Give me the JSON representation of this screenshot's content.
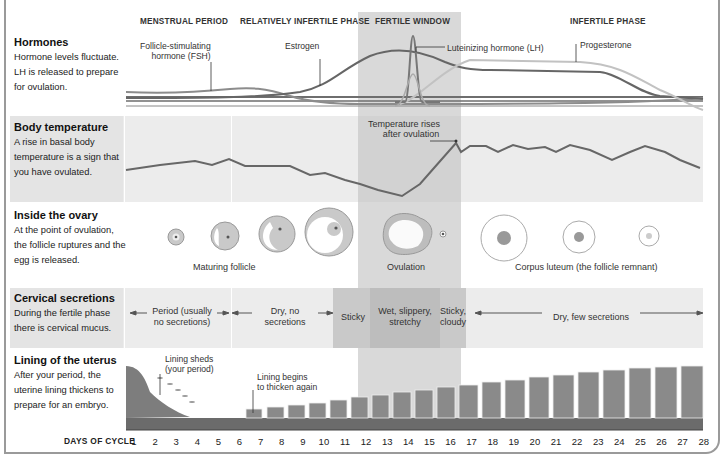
{
  "phases": [
    {
      "label": "MENSTRUAL PERIOD",
      "x": 140
    },
    {
      "label": "RELATIVELY INFERTILE PHASE",
      "x": 240
    },
    {
      "label": "FERTILE WINDOW",
      "x": 373
    },
    {
      "label": "INFERTILE PHASE",
      "x": 568
    }
  ],
  "sections": {
    "hormones": {
      "title": "Hormones",
      "description": "Hormone levels fluctuate. LH is released to prepare for ovulation.",
      "labels": {
        "fsh": "Follicle-stimulating hormone (FSH)",
        "fsh_line1": "Follicle-stimulating",
        "fsh_line2": "hormone (FSH)",
        "estrogen": "Estrogen",
        "lh": "Luteinizing hormone (LH)",
        "progesterone": "Progesterone"
      }
    },
    "body_temperature": {
      "title": "Body temperature",
      "description": "A rise in basal body temperature is a sign that you have ovulated.",
      "annotation_line1": "Temperature rises",
      "annotation_line2": "after ovulation"
    },
    "ovary": {
      "title": "Inside the ovary",
      "description": "At the point of ovulation, the follicle ruptures and the egg is released.",
      "labels": {
        "maturing": "Maturing follicle",
        "ovulation": "Ovulation",
        "corpus_luteum": "Corpus luteum (the follicle remnant)"
      }
    },
    "cervical": {
      "title": "Cervical secretions",
      "description": "During the fertile phase there is cervical mucus.",
      "segments": {
        "period_l1": "Period (usually",
        "period_l2": "no secretions)",
        "dry_l1": "Dry, no",
        "dry_l2": "secretions",
        "sticky": "Sticky",
        "wet_l1": "Wet, slippery,",
        "wet_l2": "stretchy",
        "cloudy_l1": "Sticky,",
        "cloudy_l2": "cloudy",
        "dry_few": "Dry, few secretions"
      }
    },
    "uterus": {
      "title": "Lining of the uterus",
      "description": "After your period, the uterine lining thickens to prepare for an embryo.",
      "labels": {
        "sheds_l1": "Lining sheds",
        "sheds_l2": "(your period)",
        "thicken_l1": "Lining begins",
        "thicken_l2": "to thicken again"
      }
    }
  },
  "axis": {
    "label": "DAYS OF CYCLE",
    "days": [
      "1",
      "2",
      "3",
      "4",
      "5",
      "6",
      "7",
      "8",
      "9",
      "10",
      "11",
      "12",
      "13",
      "14",
      "15",
      "16",
      "17",
      "18",
      "19",
      "20",
      "21",
      "22",
      "23",
      "24",
      "25",
      "26",
      "27",
      "28"
    ]
  },
  "colors": {
    "fsh": "#8c8c8c",
    "estrogen": "#6e6e6e",
    "lh": "#9a9a9a",
    "progesterone": "#c4c4c4",
    "baseline": "#555555",
    "temperature": "#6a6a6a",
    "fertile_window": "#d9d9d9",
    "band": "#ececec"
  },
  "chart_data": {
    "type": "line",
    "xlabel": "DAYS OF CYCLE",
    "x": [
      1,
      2,
      3,
      4,
      5,
      6,
      7,
      8,
      9,
      10,
      11,
      12,
      13,
      14,
      15,
      16,
      17,
      18,
      19,
      20,
      21,
      22,
      23,
      24,
      25,
      26,
      27,
      28
    ],
    "series": [
      {
        "name": "Basal body temperature (relative)",
        "values": [
          40,
          42,
          44,
          45,
          43,
          46,
          43,
          43,
          43,
          40,
          37,
          38,
          36,
          33,
          30,
          38,
          62,
          58,
          62,
          60,
          62,
          60,
          61,
          59,
          55,
          58,
          62,
          50
        ]
      }
    ]
  }
}
